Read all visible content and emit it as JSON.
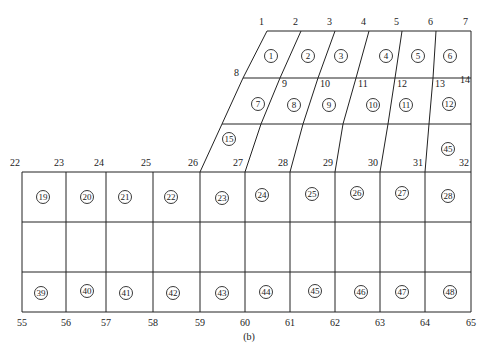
{
  "caption": "(b)",
  "grid": {
    "top_nodes": [
      {
        "id": "1",
        "x": 267,
        "y": 31
      },
      {
        "id": "2",
        "x": 301,
        "y": 31
      },
      {
        "id": "3",
        "x": 335,
        "y": 31
      },
      {
        "id": "4",
        "x": 369,
        "y": 31
      },
      {
        "id": "5",
        "x": 402,
        "y": 31
      },
      {
        "id": "6",
        "x": 436,
        "y": 31
      },
      {
        "id": "7",
        "x": 471,
        "y": 31
      }
    ],
    "row2_nodes": [
      {
        "id": "8",
        "x": 243,
        "y": 78
      },
      {
        "id": "9",
        "x": 280,
        "y": 78
      },
      {
        "id": "10",
        "x": 318,
        "y": 78
      },
      {
        "id": "11",
        "x": 356,
        "y": 78
      },
      {
        "id": "12",
        "x": 395,
        "y": 78
      },
      {
        "id": "13",
        "x": 433,
        "y": 78
      },
      {
        "id": "14",
        "x": 471,
        "y": 78
      }
    ],
    "row3_points": [
      {
        "x": 222,
        "y": 124
      },
      {
        "x": 261,
        "y": 124
      },
      {
        "x": 303,
        "y": 124
      },
      {
        "x": 343,
        "y": 124
      },
      {
        "x": 388,
        "y": 124
      },
      {
        "x": 429,
        "y": 124
      },
      {
        "x": 471,
        "y": 124
      }
    ],
    "row4_nodes": [
      {
        "id": "22",
        "x": 22,
        "y": 172
      },
      {
        "id": "23",
        "x": 66,
        "y": 172
      },
      {
        "id": "24",
        "x": 106,
        "y": 172
      },
      {
        "id": "25",
        "x": 153,
        "y": 172
      },
      {
        "id": "26",
        "x": 200,
        "y": 172
      },
      {
        "id": "27",
        "x": 245,
        "y": 172
      },
      {
        "id": "28",
        "x": 290,
        "y": 172
      },
      {
        "id": "29",
        "x": 335,
        "y": 172
      },
      {
        "id": "30",
        "x": 380,
        "y": 172
      },
      {
        "id": "31",
        "x": 425,
        "y": 172
      },
      {
        "id": "32",
        "x": 471,
        "y": 172
      }
    ],
    "row5_y": 222,
    "row6_y": 272,
    "bottom_nodes": [
      {
        "id": "55",
        "x": 22,
        "y": 312
      },
      {
        "id": "56",
        "x": 66,
        "y": 312
      },
      {
        "id": "57",
        "x": 106,
        "y": 312
      },
      {
        "id": "58",
        "x": 153,
        "y": 312
      },
      {
        "id": "59",
        "x": 200,
        "y": 312
      },
      {
        "id": "60",
        "x": 245,
        "y": 312
      },
      {
        "id": "61",
        "x": 290,
        "y": 312
      },
      {
        "id": "62",
        "x": 335,
        "y": 312
      },
      {
        "id": "63",
        "x": 380,
        "y": 312
      },
      {
        "id": "64",
        "x": 425,
        "y": 312
      },
      {
        "id": "65",
        "x": 471,
        "y": 312
      }
    ]
  },
  "elements": [
    {
      "id": "1",
      "x": 271,
      "y": 56
    },
    {
      "id": "2",
      "x": 308,
      "y": 56
    },
    {
      "id": "3",
      "x": 341,
      "y": 56
    },
    {
      "id": "4",
      "x": 386,
      "y": 56
    },
    {
      "id": "5",
      "x": 418,
      "y": 56
    },
    {
      "id": "6",
      "x": 450,
      "y": 56
    },
    {
      "id": "7",
      "x": 258,
      "y": 104
    },
    {
      "id": "8",
      "x": 294,
      "y": 105
    },
    {
      "id": "9",
      "x": 329,
      "y": 105
    },
    {
      "id": "10",
      "x": 373,
      "y": 105
    },
    {
      "id": "11",
      "x": 406,
      "y": 105
    },
    {
      "id": "12",
      "x": 449,
      "y": 104
    },
    {
      "id": "15",
      "x": 229,
      "y": 139
    },
    {
      "id": "45",
      "x": 448,
      "y": 149
    },
    {
      "id": "19",
      "x": 43,
      "y": 197
    },
    {
      "id": "20",
      "x": 87,
      "y": 197
    },
    {
      "id": "21",
      "x": 125,
      "y": 197
    },
    {
      "id": "22",
      "x": 171,
      "y": 197
    },
    {
      "id": "23",
      "x": 222,
      "y": 198
    },
    {
      "id": "24",
      "x": 262,
      "y": 195
    },
    {
      "id": "25",
      "x": 312,
      "y": 194
    },
    {
      "id": "26",
      "x": 357,
      "y": 193
    },
    {
      "id": "27",
      "x": 402,
      "y": 193
    },
    {
      "id": "28",
      "x": 448,
      "y": 196
    },
    {
      "id": "39",
      "x": 41,
      "y": 293
    },
    {
      "id": "40",
      "x": 87,
      "y": 291
    },
    {
      "id": "41",
      "x": 126,
      "y": 293
    },
    {
      "id": "42",
      "x": 173,
      "y": 293
    },
    {
      "id": "43",
      "x": 222,
      "y": 293
    },
    {
      "id": "44",
      "x": 266,
      "y": 292
    },
    {
      "id": "45b",
      "label": "45",
      "x": 315,
      "y": 291
    },
    {
      "id": "46",
      "x": 361,
      "y": 292
    },
    {
      "id": "47",
      "x": 402,
      "y": 292
    },
    {
      "id": "48",
      "x": 450,
      "y": 292
    }
  ]
}
